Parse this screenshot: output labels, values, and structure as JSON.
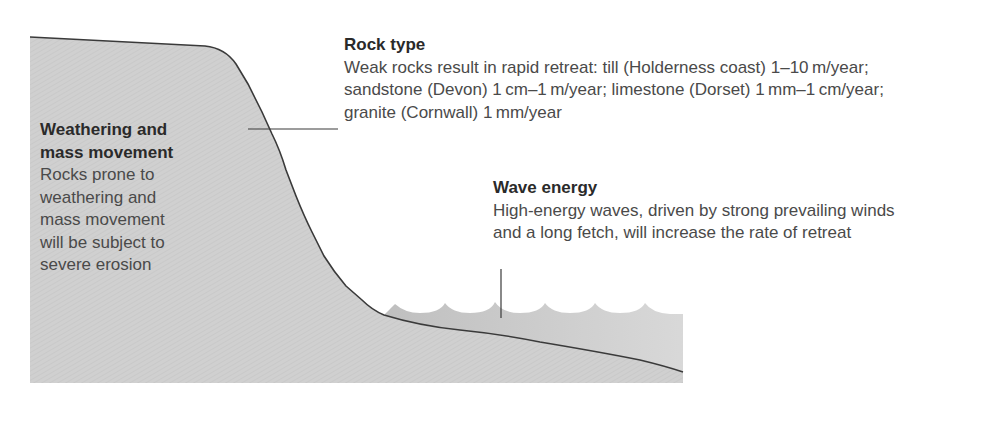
{
  "diagram": {
    "colors": {
      "cliff_fill": "#cfcfcf",
      "sea_fill": "#bdbdbd",
      "outline": "#3a3a3a",
      "text_body": "#4a4a4a",
      "text_title": "#2a2a2a"
    }
  },
  "labels": {
    "rock_type": {
      "title": "Rock type",
      "lines": [
        "Weak rocks result in rapid retreat: till (Holderness coast) 1–10 m/year;",
        "sandstone (Devon) 1 cm–1 m/year; limestone (Dorset) 1 mm–1 cm/year;",
        "granite (Cornwall) 1 mm/year"
      ]
    },
    "weathering": {
      "title_lines": [
        "Weathering and",
        "mass movement"
      ],
      "lines": [
        "Rocks prone to",
        "weathering and",
        "mass movement",
        "will be subject to",
        "severe erosion"
      ]
    },
    "wave_energy": {
      "title": "Wave energy",
      "lines": [
        "High-energy waves, driven by strong prevailing winds",
        "and a long fetch, will increase the rate of retreat"
      ]
    }
  }
}
